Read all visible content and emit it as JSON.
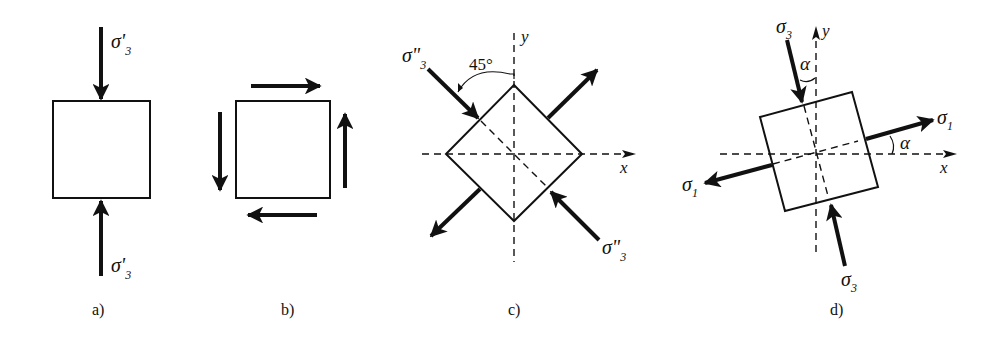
{
  "figure": {
    "background": "#ffffff",
    "ink": "#111111",
    "panels": [
      {
        "id": "a",
        "caption": "a)",
        "description": "Square element under uniaxial compression",
        "labels": {
          "top_stress": "σ'",
          "top_sub": "3",
          "bottom_stress": "σ'",
          "bottom_sub": "3"
        }
      },
      {
        "id": "b",
        "caption": "b)",
        "description": "Square element under pure shear"
      },
      {
        "id": "c",
        "caption": "c)",
        "description": "Element rotated 45° with principal stresses",
        "labels": {
          "axis_x": "x",
          "axis_y": "y",
          "angle": "45°",
          "stress_top": "σ\"",
          "stress_top_sub": "3",
          "stress_bottom": "σ\"",
          "stress_bottom_sub": "3"
        }
      },
      {
        "id": "d",
        "caption": "d)",
        "description": "Element rotated by angle alpha with principal stresses σ1 and σ3",
        "labels": {
          "axis_x": "x",
          "axis_y": "y",
          "angle_top": "α",
          "angle_right": "α",
          "sigma3": "σ",
          "sigma3_sub": "3",
          "sigma1": "σ",
          "sigma1_sub": "1"
        }
      }
    ]
  }
}
